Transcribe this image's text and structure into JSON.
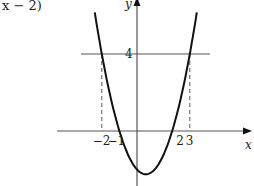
{
  "caption": {
    "text": "x − 2)"
  },
  "chart_data": {
    "type": "line",
    "title": "",
    "function": "y = (x + 1)(x − 2)",
    "xlabel": "x",
    "ylabel": "y",
    "x_ticks": [
      {
        "value": -2,
        "label": "−2"
      },
      {
        "value": -1,
        "label": "−1"
      },
      {
        "value": 2,
        "label": "2"
      },
      {
        "value": 3,
        "label": "3"
      }
    ],
    "y_ticks": [
      {
        "value": 4,
        "label": "4"
      }
    ],
    "horizontal_line": {
      "y": 4,
      "x_from": -3.1,
      "x_to": 4.2
    },
    "dashed_verticals": [
      {
        "x": -2,
        "y_to": 4
      },
      {
        "x": 3,
        "y_to": 4
      }
    ],
    "series": [
      {
        "name": "parabola",
        "x": [
          -2.4,
          -2,
          -1.5,
          -1,
          -0.5,
          0,
          0.5,
          1,
          1.5,
          2,
          2.5,
          3,
          3.4
        ],
        "y": [
          5.36,
          4,
          1.75,
          0,
          -1.25,
          -2,
          -2.25,
          -2,
          -1.25,
          0,
          1.75,
          4,
          5.16
        ]
      }
    ],
    "vertex": {
      "x": 0.5,
      "y": -2.25
    },
    "xlim": [
      -4.6,
      6.5
    ],
    "ylim": [
      -2.9,
      6.9
    ],
    "grid": false,
    "legend": null
  }
}
